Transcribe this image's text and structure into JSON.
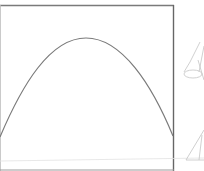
{
  "diagram": {
    "colors": {
      "frame": "#6e6e6e",
      "curve": "#7a7a7a",
      "sketch": "#c4c4c4",
      "background": "#ffffff"
    },
    "frame": {
      "x": 0,
      "y": 5,
      "width": 174,
      "height": 166
    },
    "arch": {
      "start": [
        0,
        137
      ],
      "apex": [
        86,
        38
      ],
      "end": [
        173,
        136
      ]
    },
    "side_sketches": [
      {
        "name": "upper-cone",
        "position": [
          182,
          40
        ]
      },
      {
        "name": "lower-triangle",
        "position": [
          185,
          125
        ]
      }
    ]
  }
}
